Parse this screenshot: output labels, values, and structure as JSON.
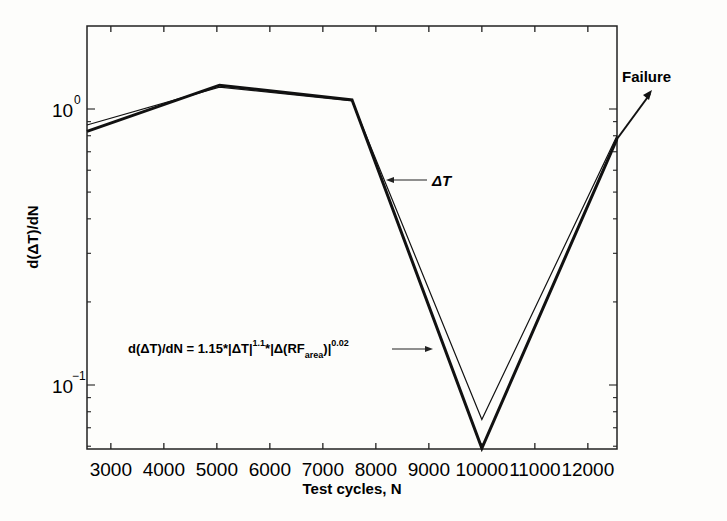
{
  "chart_data": {
    "type": "line",
    "title": "",
    "xlabel": "Test cycles, N",
    "ylabel": "d(ΔT)/dN",
    "yscale": "log",
    "xlim": [
      2550,
      12550
    ],
    "ylim": [
      0.055,
      2.0
    ],
    "x_ticks": [
      "3000",
      "4000",
      "5000",
      "6000",
      "7000",
      "8000",
      "9000",
      "10000",
      "11000",
      "12000"
    ],
    "y_ticks": [
      {
        "base": "10",
        "exp": "0",
        "value": 1
      },
      {
        "base": "10",
        "exp": "−1",
        "value": 0.1
      }
    ],
    "grid": false,
    "series": [
      {
        "name": "ΔT (measured)",
        "style": "thick",
        "x": [
          2550,
          5050,
          7550,
          10000,
          12550
        ],
        "y": [
          0.83,
          1.22,
          1.08,
          0.059,
          0.78
        ]
      },
      {
        "name": "d(ΔT)/dN = 1.15*|ΔT|^1.1*|Δ(RF_area)|^0.02",
        "style": "thin",
        "x": [
          2550,
          5050,
          7550,
          10000,
          12550
        ],
        "y": [
          0.875,
          1.2,
          1.07,
          0.075,
          0.8
        ]
      }
    ],
    "annotations": [
      {
        "text": "Failure",
        "arrow": true
      },
      {
        "text": "ΔT",
        "arrow": true
      },
      {
        "text": "d(ΔT)/dN = 1.15*|ΔT|^1.1*|Δ(RF_area)|^0.02",
        "arrow": true
      }
    ]
  },
  "labels": {
    "xlabel": "Test cycles, N",
    "ylabel": "d(ΔT)/dN",
    "failure": "Failure",
    "delta_t": "ΔT",
    "formula": {
      "lhs": "d(ΔT)/dN = 1.15*|ΔT|",
      "exp1": "1.1",
      "mid": "*|Δ(RF",
      "sub": "area",
      "close": ")|",
      "exp2": "0.02"
    }
  }
}
